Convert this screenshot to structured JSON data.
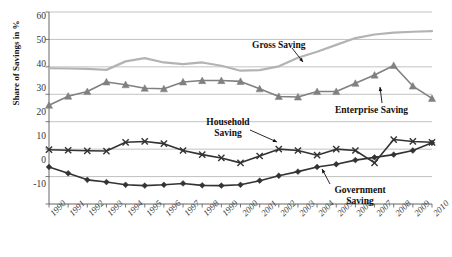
{
  "chart_data": {
    "type": "line",
    "title": "",
    "xlabel": "",
    "ylabel": "Share of Savings in %",
    "ylim": [
      -10,
      60
    ],
    "yticks": [
      -10,
      0,
      10,
      20,
      30,
      40,
      50,
      60
    ],
    "grid": true,
    "legend_position": "inline-annotations",
    "categories": [
      "1990",
      "1991",
      "1992",
      "1993",
      "1994",
      "1995",
      "1996",
      "1997",
      "1998",
      "1999",
      "2000",
      "2001",
      "2002",
      "2003",
      "2004",
      "2005",
      "2006",
      "2007",
      "2008",
      "2009",
      "2010"
    ],
    "series": [
      {
        "name": "Gross Saving",
        "color": "#b3b3b3",
        "marker": "none",
        "values": [
          39.5,
          39.4,
          39.3,
          38.9,
          42.0,
          43.2,
          41.6,
          41.0,
          41.6,
          40.4,
          38.6,
          38.8,
          40.2,
          43.3,
          45.5,
          48.0,
          50.5,
          51.8,
          52.5,
          52.8,
          53.0
        ]
      },
      {
        "name": "Enterprise Saving",
        "color": "#808080",
        "marker": "triangle",
        "values": [
          26.0,
          29.3,
          31.0,
          34.5,
          33.5,
          32.2,
          32.0,
          34.5,
          35.0,
          35.0,
          34.7,
          32.0,
          29.2,
          29.0,
          31.0,
          31.0,
          34.0,
          37.0,
          40.5,
          33.0,
          28.5
        ]
      },
      {
        "name": "Household Saving",
        "color": "#333333",
        "marker": "x",
        "values": [
          9.8,
          9.6,
          9.4,
          9.3,
          12.5,
          12.8,
          12.0,
          9.5,
          8.0,
          6.8,
          5.0,
          7.5,
          10.0,
          9.5,
          7.8,
          10.0,
          9.5,
          5.0,
          13.5,
          12.8,
          12.5
        ]
      },
      {
        "name": "Government Saving",
        "color": "#333333",
        "marker": "diamond",
        "values": [
          3.5,
          1.2,
          -1.2,
          -2.0,
          -3.0,
          -3.3,
          -3.0,
          -2.5,
          -3.2,
          -3.3,
          -3.0,
          -1.5,
          0.3,
          1.8,
          3.5,
          4.5,
          6.0,
          7.0,
          8.0,
          9.5,
          12.3
        ]
      }
    ],
    "annotations": [
      {
        "id": "gross-saving",
        "text": "Gross Saving",
        "lines": [
          "Gross Saving"
        ]
      },
      {
        "id": "enterprise-saving",
        "text": "Enterprise Saving",
        "lines": [
          "Enterprise Saving"
        ]
      },
      {
        "id": "household-saving",
        "text": "Household Saving",
        "lines": [
          "Household",
          "Saving"
        ]
      },
      {
        "id": "government-saving",
        "text": "Government Saving",
        "lines": [
          "Government",
          "Saving"
        ]
      }
    ]
  },
  "axis": {
    "y_label": "Share of Savings in %",
    "y_ticks": [
      "60",
      "50",
      "40",
      "30",
      "20",
      "10",
      "0",
      "-10"
    ],
    "x_ticks": [
      "1990",
      "1991",
      "1992",
      "1993",
      "1994",
      "1995",
      "1996",
      "1997",
      "1998",
      "1999",
      "2000",
      "2001",
      "2002",
      "2003",
      "2004",
      "2005",
      "2006",
      "2007",
      "2008",
      "2009",
      "2010"
    ]
  },
  "labels": {
    "gross_saving": "Gross Saving",
    "enterprise_saving": "Enterprise Saving",
    "household_line1": "Household",
    "household_line2": "Saving",
    "government_line1": "Government",
    "government_line2": "Saving"
  },
  "colors": {
    "gross": "#b3b3b3",
    "enterprise": "#808080",
    "household": "#333333",
    "government": "#333333",
    "grid": "#a6a6a6",
    "axis": "#555555"
  }
}
